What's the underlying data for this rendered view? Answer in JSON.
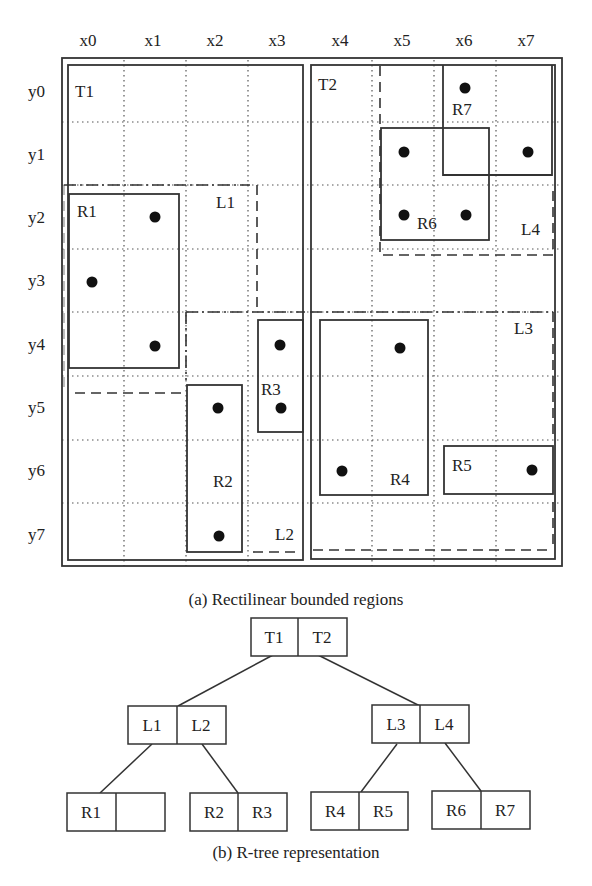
{
  "header_fragment": "... of ... bounded regions ...",
  "grid": {
    "x_labels": [
      "x0",
      "x1",
      "x2",
      "x3",
      "x4",
      "x5",
      "x6",
      "x7"
    ],
    "y_labels": [
      "y0",
      "y1",
      "y2",
      "y3",
      "y4",
      "y5",
      "y6",
      "y7"
    ],
    "origin": [
      62,
      58
    ],
    "cell": 62.6
  },
  "regions": {
    "T1": {
      "label": "T1",
      "style": "solid"
    },
    "T2": {
      "label": "T2",
      "style": "solid"
    },
    "L1": {
      "label": "L1",
      "style": "dash-dot/dashed"
    },
    "L2": {
      "label": "L2",
      "style": "dash-dot/dashed"
    },
    "L3": {
      "label": "L3",
      "style": "dash-dot/dashed"
    },
    "L4": {
      "label": "L4",
      "style": "dashed"
    },
    "R1": {
      "label": "R1"
    },
    "R2": {
      "label": "R2"
    },
    "R3": {
      "label": "R3"
    },
    "R4": {
      "label": "R4"
    },
    "R5": {
      "label": "R5"
    },
    "R6": {
      "label": "R6"
    },
    "R7": {
      "label": "R7"
    }
  },
  "points": [
    {
      "x": 6,
      "y": 0
    },
    {
      "x": 5,
      "y": 1
    },
    {
      "x": 7,
      "y": 1
    },
    {
      "x": 1,
      "y": 2
    },
    {
      "x": 5,
      "y": 2
    },
    {
      "x": 6,
      "y": 2
    },
    {
      "x": 0,
      "y": 3
    },
    {
      "x": 1,
      "y": 4
    },
    {
      "x": 3,
      "y": 4
    },
    {
      "x": 5,
      "y": 4
    },
    {
      "x": 2,
      "y": 5
    },
    {
      "x": 3,
      "y": 5
    },
    {
      "x": 4,
      "y": 6
    },
    {
      "x": 7,
      "y": 6
    },
    {
      "x": 2,
      "y": 7
    }
  ],
  "captions": {
    "a": "(a) Rectilinear bounded regions",
    "b": "(b) R-tree representation"
  },
  "tree": {
    "root": [
      "T1",
      "T2"
    ],
    "level1": [
      [
        "L1",
        "L2"
      ],
      [
        "L3",
        "L4"
      ]
    ],
    "leaves": [
      [
        "R1",
        ""
      ],
      [
        "R2",
        "R3"
      ],
      [
        "R4",
        "R5"
      ],
      [
        "R6",
        "R7"
      ]
    ]
  }
}
